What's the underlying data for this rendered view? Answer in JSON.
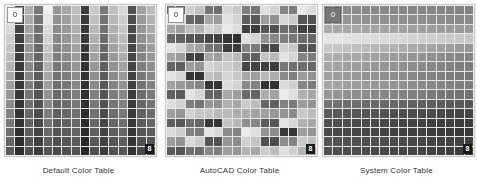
{
  "panels": [
    {
      "id": "default",
      "caption": "Default Color Table",
      "start_label": "0",
      "end_label": "8",
      "pattern": "columns"
    },
    {
      "id": "autocad",
      "caption": "AutoCAD Color Table",
      "start_label": "0",
      "end_label": "8",
      "pattern": "random"
    },
    {
      "id": "system",
      "caption": "System Color Table",
      "start_label": "0",
      "end_label": "8",
      "pattern": "rows"
    }
  ],
  "grid": {
    "rows": 16,
    "cols": 16
  }
}
